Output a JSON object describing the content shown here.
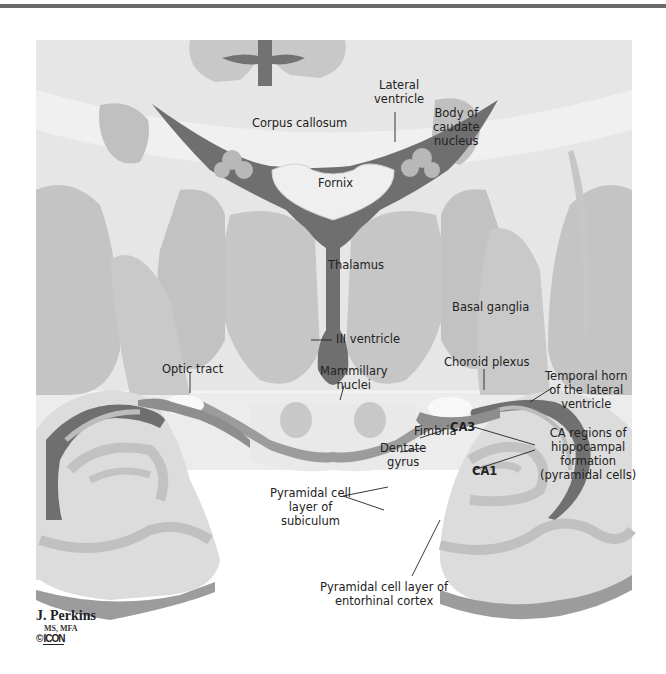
{
  "labels": {
    "lateral_ventricle": [
      "Lateral",
      "ventricle"
    ],
    "corpus_callosum": "Corpus callosum",
    "body_caudate": [
      "Body of",
      "caudate",
      "nucleus"
    ],
    "fornix": "Fornix",
    "thalamus": "Thalamus",
    "basal_ganglia": "Basal ganglia",
    "iii_ventricle": "III ventricle",
    "optic_tract": "Optic tract",
    "mammillary": [
      "Mammillary",
      "nuclei"
    ],
    "choroid_plexus": "Choroid plexus",
    "temporal_horn": [
      "Temporal horn",
      "of the lateral",
      "ventricle"
    ],
    "fimbria": "Fimbria",
    "ca3": "CA3",
    "ca1": "CA1",
    "ca_regions": [
      "CA regions of",
      "hippocampal",
      "formation",
      "(pyramidal cells)"
    ],
    "dentate_gyrus": [
      "Dentate",
      "gyrus"
    ],
    "pyramidal_subiculum": [
      "Pyramidal cell",
      "layer of",
      "subiculum"
    ],
    "pyramidal_entorhinal": [
      "Pyramidal cell layer of",
      "entorhinal cortex"
    ]
  },
  "credit": {
    "name": "J. Perkins",
    "degrees": "MS, MFA",
    "copyright": "©",
    "logo": "ICON"
  },
  "colors": {
    "background_panel": "#e8e8e8",
    "white_matter": "#f2f2f2",
    "gray_matter": "#c4c4c4",
    "ventricle": "#6e6e6e",
    "cut_edge": "#9a9a9a"
  }
}
